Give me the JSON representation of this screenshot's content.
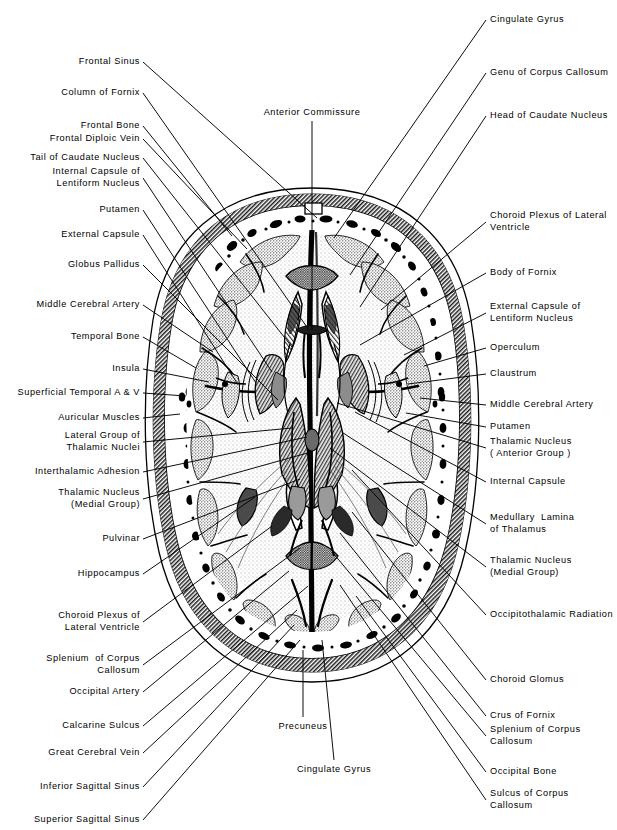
{
  "figure": {
    "type": "anatomical-illustration",
    "style": "black-and-white stipple engraving with radiating leader lines"
  },
  "labels_left": [
    {
      "text": [
        "Frontal Sinus"
      ],
      "x": 140,
      "y": 62,
      "tx": 317,
      "ty": 218
    },
    {
      "text": [
        "Column of Fornix"
      ],
      "x": 140,
      "y": 93,
      "tx": 309,
      "ty": 330
    },
    {
      "text": [
        "Frontal Bone"
      ],
      "x": 140,
      "y": 126,
      "tx": 232,
      "ty": 236
    },
    {
      "text": [
        "Frontal Diploic Vein"
      ],
      "x": 140,
      "y": 139,
      "tx": 247,
      "ty": 249
    },
    {
      "text": [
        "Tail of Caudate Nucleus"
      ],
      "x": 140,
      "y": 158,
      "tx": 292,
      "ty": 347
    },
    {
      "text": [
        "Internal Capsule of",
        "Lentiform Nucleus"
      ],
      "x": 140,
      "y": 178,
      "tx": 272,
      "ty": 372
    },
    {
      "text": [
        "Putamen"
      ],
      "x": 140,
      "y": 210,
      "tx": 256,
      "ty": 383
    },
    {
      "text": [
        "External Capsule"
      ],
      "x": 140,
      "y": 235,
      "tx": 237,
      "ty": 383
    },
    {
      "text": [
        "Globus Pallidus"
      ],
      "x": 140,
      "y": 265,
      "tx": 278,
      "ty": 400
    },
    {
      "text": [
        "Middle Cerebral Artery"
      ],
      "x": 140,
      "y": 305,
      "tx": 213,
      "ty": 352
    },
    {
      "text": [
        "Temporal Bone"
      ],
      "x": 140,
      "y": 337,
      "tx": 196,
      "ty": 368
    },
    {
      "text": [
        "Insula"
      ],
      "x": 140,
      "y": 369,
      "tx": 209,
      "ty": 382
    },
    {
      "text": [
        "Superficial Temporal A & V"
      ],
      "x": 140,
      "y": 393,
      "tx": 186,
      "ty": 396
    },
    {
      "text": [
        "Auricular Muscles"
      ],
      "x": 140,
      "y": 418,
      "tx": 180,
      "ty": 414
    },
    {
      "text": [
        "Lateral Group of",
        "Thalamic Nuclei"
      ],
      "x": 140,
      "y": 442,
      "tx": 292,
      "ty": 428
    },
    {
      "text": [
        "Interthalamic Adhesion"
      ],
      "x": 140,
      "y": 472,
      "tx": 307,
      "ty": 437
    },
    {
      "text": [
        "Thalamic Nucleus",
        "(Medial Group)"
      ],
      "x": 140,
      "y": 499,
      "tx": 311,
      "ty": 452
    },
    {
      "text": [
        "Pulvinar"
      ],
      "x": 140,
      "y": 539,
      "tx": 300,
      "ty": 479
    },
    {
      "text": [
        "Hippocampus"
      ],
      "x": 140,
      "y": 574,
      "tx": 255,
      "ty": 497
    },
    {
      "text": [
        "Choroid Plexus of",
        "Lateral Ventricle"
      ],
      "x": 140,
      "y": 622,
      "tx": 272,
      "ty": 526
    },
    {
      "text": [
        "Splenium  of Corpus",
        "Callosum"
      ],
      "x": 140,
      "y": 665,
      "tx": 300,
      "ty": 548
    },
    {
      "text": [
        "Occipital Artery"
      ],
      "x": 140,
      "y": 692,
      "tx": 289,
      "ty": 571
    },
    {
      "text": [
        "Calcarine Sulcus"
      ],
      "x": 140,
      "y": 726,
      "tx": 308,
      "ty": 586
    },
    {
      "text": [
        "Great Cerebral Vein"
      ],
      "x": 140,
      "y": 753,
      "tx": 297,
      "ty": 610
    },
    {
      "text": [
        "Inferior Sagittal Sinus"
      ],
      "x": 140,
      "y": 787,
      "tx": 294,
      "ty": 625
    },
    {
      "text": [
        "Superior Sagittal Sinus"
      ],
      "x": 140,
      "y": 820,
      "tx": 300,
      "ty": 640
    }
  ],
  "labels_right": [
    {
      "text": [
        "Cingulate Gyrus"
      ],
      "x": 490,
      "y": 20,
      "tx": 334,
      "ty": 238
    },
    {
      "text": [
        "Genu of Corpus Callosum"
      ],
      "x": 490,
      "y": 73,
      "tx": 350,
      "ty": 275
    },
    {
      "text": [
        "Head of Caudate Nucleus"
      ],
      "x": 490,
      "y": 116,
      "tx": 360,
      "ty": 307
    },
    {
      "text": [
        "Choroid Plexus of Lateral",
        "Ventricle"
      ],
      "x": 490,
      "y": 222,
      "tx": 381,
      "ty": 310
    },
    {
      "text": [
        "Body of Fornix"
      ],
      "x": 490,
      "y": 273,
      "tx": 360,
      "ty": 345
    },
    {
      "text": [
        "External Capsule of",
        "Lentiform Nucleus"
      ],
      "x": 490,
      "y": 313,
      "tx": 404,
      "ty": 355
    },
    {
      "text": [
        "Operculum"
      ],
      "x": 490,
      "y": 348,
      "tx": 424,
      "ty": 366
    },
    {
      "text": [
        "Claustrum"
      ],
      "x": 490,
      "y": 374,
      "tx": 408,
      "ty": 384
    },
    {
      "text": [
        "Middle Cerebral Artery"
      ],
      "x": 490,
      "y": 405,
      "tx": 420,
      "ty": 398
    },
    {
      "text": [
        "Putamen"
      ],
      "x": 490,
      "y": 427,
      "tx": 406,
      "ty": 413
    },
    {
      "text": [
        "Thalamic Nucleus",
        "( Anterior Group )"
      ],
      "x": 490,
      "y": 448,
      "tx": 337,
      "ty": 403
    },
    {
      "text": [
        "Internal Capsule"
      ],
      "x": 490,
      "y": 482,
      "tx": 355,
      "ty": 412
    },
    {
      "text": [
        "Medullary  Lamina",
        "of Thalamus"
      ],
      "x": 490,
      "y": 524,
      "tx": 343,
      "ty": 433
    },
    {
      "text": [
        "Thalamic Nucleus",
        "(Medial Group)"
      ],
      "x": 490,
      "y": 567,
      "tx": 330,
      "ty": 448
    },
    {
      "text": [
        "Occipitothalamic Radiation"
      ],
      "x": 490,
      "y": 615,
      "tx": 352,
      "ty": 470
    },
    {
      "text": [
        "Choroid Glomus"
      ],
      "x": 490,
      "y": 680,
      "tx": 352,
      "ty": 512
    },
    {
      "text": [
        "Crus of Fornix"
      ],
      "x": 490,
      "y": 716,
      "tx": 340,
      "ty": 533
    },
    {
      "text": [
        "Splenium of Corpus",
        "Callosum"
      ],
      "x": 490,
      "y": 736,
      "tx": 333,
      "ty": 553
    },
    {
      "text": [
        "Occipital Bone"
      ],
      "x": 490,
      "y": 772,
      "tx": 356,
      "ty": 596
    },
    {
      "text": [
        "Sulcus of Corpus",
        "Callosum"
      ],
      "x": 490,
      "y": 800,
      "tx": 340,
      "ty": 585
    }
  ],
  "labels_center": [
    {
      "text": [
        "Anterior Commissure"
      ],
      "x": 312,
      "y": 113,
      "tx": 312,
      "ty": 330,
      "align": "center"
    },
    {
      "text": [
        "Precuneus"
      ],
      "x": 303,
      "y": 727,
      "tx": 303,
      "ty": 650,
      "align": "center"
    },
    {
      "text": [
        "Cingulate Gyrus"
      ],
      "x": 334,
      "y": 770,
      "tx": 322,
      "ty": 640,
      "align": "center"
    }
  ],
  "colors": {
    "ink": "#000000",
    "paper": "#ffffff",
    "bone_fill": "#e9e9e9",
    "scalp": "#6a6a6a",
    "grey_matter": "#c9c9c9",
    "white_matter": "#f2f2f2",
    "thalamus": "#9b9b9b"
  }
}
